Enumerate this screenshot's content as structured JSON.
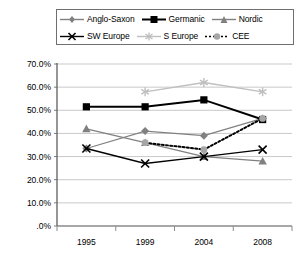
{
  "chart_data": {
    "type": "line",
    "title": "",
    "xlabel": "",
    "ylabel": "",
    "categories": [
      "1995",
      "1999",
      "2004",
      "2008"
    ],
    "ylim": [
      0,
      70
    ],
    "ytick_labels": [
      "70.0%",
      "60.0%",
      "50.0%",
      "40.0%",
      "30.0%",
      "20.0%",
      "10.0%",
      ".0%"
    ],
    "ytick_values": [
      70,
      60,
      50,
      40,
      30,
      20,
      10,
      0
    ],
    "grid": true,
    "legend_position": "top",
    "series": [
      {
        "name": "Anglo-Saxon",
        "marker": "diamond",
        "color": "#808080",
        "line_style": "solid",
        "values": [
          33.5,
          41.0,
          39.0,
          46.5
        ]
      },
      {
        "name": "Germanic",
        "marker": "square",
        "color": "#000000",
        "line_style": "solid",
        "values": [
          51.5,
          51.5,
          54.5,
          46.0
        ]
      },
      {
        "name": "Nordic",
        "marker": "triangle",
        "color": "#808080",
        "line_style": "solid",
        "values": [
          42.0,
          36.0,
          30.0,
          28.0
        ]
      },
      {
        "name": "SW Europe",
        "marker": "cross",
        "color": "#000000",
        "line_style": "solid",
        "values": [
          33.5,
          27.0,
          30.0,
          33.0
        ]
      },
      {
        "name": "S Europe",
        "marker": "asterisk",
        "color": "#bfbfbf",
        "line_style": "solid",
        "values": [
          null,
          58.0,
          62.0,
          58.0
        ]
      },
      {
        "name": "CEE",
        "marker": "circle",
        "color": "#8c8c8c",
        "line_style": "dotted",
        "values": [
          null,
          36.0,
          33.0,
          46.5
        ]
      }
    ]
  },
  "legend": {
    "rows": [
      [
        {
          "label": "Anglo-Saxon",
          "symbol": "diamond-line"
        },
        {
          "label": "Germanic",
          "symbol": "square-line"
        },
        {
          "label": "Nordic",
          "symbol": "triangle-line"
        }
      ],
      [
        {
          "label": "SW Europe",
          "symbol": "cross-line"
        },
        {
          "label": "S Europe",
          "symbol": "asterisk-line"
        },
        {
          "label": "CEE",
          "symbol": "circle-dotted-line"
        }
      ]
    ]
  },
  "axes": {
    "y_ticks": [
      "70.0%",
      "60.0%",
      "50.0%",
      "40.0%",
      "30.0%",
      "20.0%",
      "10.0%",
      ".0%"
    ],
    "x_ticks": [
      "1995",
      "1999",
      "2004",
      "2008"
    ]
  }
}
